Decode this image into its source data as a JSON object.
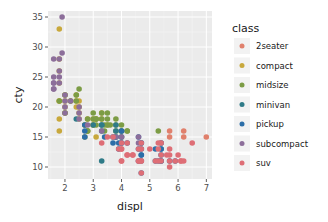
{
  "chart_data": {
    "type": "scatter",
    "title": "",
    "xlabel": "displ",
    "ylabel": "cty",
    "xlim": [
      1.4,
      7.2
    ],
    "ylim": [
      8,
      36
    ],
    "x_ticks": [
      2,
      3,
      4,
      5,
      6,
      7
    ],
    "y_ticks": [
      10,
      15,
      20,
      25,
      30,
      35
    ],
    "grid": true,
    "legend_position": "right",
    "legend_title": "class",
    "series": [
      {
        "name": "2seater",
        "color": "#E0806C",
        "points": [
          [
            5.7,
            16
          ],
          [
            5.7,
            15
          ],
          [
            6.2,
            16
          ],
          [
            6.2,
            15
          ],
          [
            7.0,
            15
          ]
        ]
      },
      {
        "name": "compact",
        "color": "#C8A83C",
        "points": [
          [
            1.8,
            18
          ],
          [
            1.8,
            21
          ],
          [
            2.0,
            20
          ],
          [
            2.0,
            21
          ],
          [
            2.8,
            16
          ],
          [
            2.8,
            18
          ],
          [
            3.1,
            18
          ],
          [
            1.8,
            28
          ],
          [
            1.8,
            26
          ],
          [
            1.8,
            24
          ],
          [
            1.8,
            21
          ],
          [
            1.8,
            16
          ],
          [
            1.8,
            33
          ],
          [
            2.0,
            22
          ],
          [
            2.0,
            19
          ],
          [
            2.4,
            21
          ],
          [
            2.4,
            22
          ],
          [
            2.5,
            21
          ],
          [
            2.5,
            20
          ],
          [
            2.5,
            19
          ],
          [
            2.2,
            21
          ],
          [
            3.0,
            18
          ],
          [
            3.3,
            19
          ],
          [
            3.0,
            17
          ],
          [
            2.5,
            18
          ],
          [
            2.7,
            17
          ],
          [
            3.1,
            15
          ],
          [
            3.3,
            18
          ],
          [
            3.5,
            17
          ],
          [
            2.4,
            20
          ]
        ]
      },
      {
        "name": "midsize",
        "color": "#7C9C45",
        "points": [
          [
            2.4,
            21
          ],
          [
            3.0,
            18
          ],
          [
            3.1,
            18
          ],
          [
            3.5,
            19
          ],
          [
            3.6,
            17
          ],
          [
            2.5,
            23
          ],
          [
            1.8,
            21
          ],
          [
            2.0,
            19
          ],
          [
            2.0,
            22
          ],
          [
            2.8,
            16
          ],
          [
            3.1,
            18
          ],
          [
            4.2,
            16
          ],
          [
            3.5,
            17
          ],
          [
            3.3,
            19
          ],
          [
            3.8,
            16
          ],
          [
            3.8,
            18
          ],
          [
            3.8,
            17
          ],
          [
            2.2,
            21
          ],
          [
            2.4,
            22
          ],
          [
            3.0,
            17
          ],
          [
            3.5,
            18
          ],
          [
            3.0,
            19
          ],
          [
            3.3,
            18
          ],
          [
            5.3,
            16
          ],
          [
            2.7,
            15
          ],
          [
            2.7,
            17
          ],
          [
            3.4,
            16
          ],
          [
            3.4,
            17
          ],
          [
            4.0,
            16
          ],
          [
            4.0,
            17
          ],
          [
            2.8,
            18
          ],
          [
            2.8,
            16
          ],
          [
            3.1,
            17
          ],
          [
            4.2,
            16
          ],
          [
            4.0,
            15
          ]
        ]
      },
      {
        "name": "minivan",
        "color": "#2F7B88",
        "points": [
          [
            2.4,
            18
          ],
          [
            3.0,
            17
          ],
          [
            3.3,
            17
          ],
          [
            3.3,
            16
          ],
          [
            3.3,
            11
          ],
          [
            3.8,
            16
          ],
          [
            3.8,
            15
          ],
          [
            4.0,
            16
          ],
          [
            3.8,
            17
          ],
          [
            3.3,
            17
          ],
          [
            3.8,
            15
          ]
        ]
      },
      {
        "name": "pickup",
        "color": "#2C6EA8",
        "points": [
          [
            2.7,
            15
          ],
          [
            2.7,
            16
          ],
          [
            2.7,
            17
          ],
          [
            3.4,
            15
          ],
          [
            3.7,
            15
          ],
          [
            3.7,
            14
          ],
          [
            3.9,
            14
          ],
          [
            3.9,
            13
          ],
          [
            4.0,
            14
          ],
          [
            4.0,
            15
          ],
          [
            4.7,
            14
          ],
          [
            4.7,
            13
          ],
          [
            4.7,
            12
          ],
          [
            4.7,
            9
          ],
          [
            5.2,
            11
          ],
          [
            5.2,
            13
          ],
          [
            5.7,
            11
          ],
          [
            5.9,
            11
          ],
          [
            4.6,
            13
          ],
          [
            5.4,
            12
          ],
          [
            5.4,
            11
          ],
          [
            5.4,
            13
          ],
          [
            4.2,
            14
          ],
          [
            4.0,
            16
          ],
          [
            4.6,
            15
          ],
          [
            5.4,
            14
          ],
          [
            4.7,
            11
          ],
          [
            5.3,
            11
          ],
          [
            5.4,
            11
          ],
          [
            5.4,
            13
          ],
          [
            4.7,
            12
          ],
          [
            4.6,
            11
          ],
          [
            4.7,
            14
          ],
          [
            4.0,
            14
          ]
        ]
      },
      {
        "name": "subcompact",
        "color": "#8C6E9A",
        "points": [
          [
            1.6,
            28
          ],
          [
            1.6,
            24
          ],
          [
            1.6,
            25
          ],
          [
            1.6,
            23
          ],
          [
            1.6,
            24
          ],
          [
            1.8,
            26
          ],
          [
            1.8,
            25
          ],
          [
            1.9,
            35
          ],
          [
            1.9,
            29
          ],
          [
            1.8,
            24
          ],
          [
            2.0,
            21
          ],
          [
            2.0,
            20
          ],
          [
            2.5,
            19
          ],
          [
            2.5,
            18
          ],
          [
            3.8,
            15
          ],
          [
            4.6,
            15
          ],
          [
            5.4,
            14
          ],
          [
            2.8,
            17
          ],
          [
            1.6,
            23
          ],
          [
            2.0,
            22
          ],
          [
            2.2,
            21
          ],
          [
            2.5,
            20
          ],
          [
            3.3,
            16
          ],
          [
            4.0,
            15
          ],
          [
            4.6,
            14
          ],
          [
            2.0,
            19
          ],
          [
            1.8,
            28
          ]
        ]
      },
      {
        "name": "suv",
        "color": "#DE6E76",
        "points": [
          [
            3.7,
            15
          ],
          [
            4.0,
            14
          ],
          [
            4.7,
            13
          ],
          [
            4.7,
            14
          ],
          [
            5.7,
            13
          ],
          [
            6.1,
            11
          ],
          [
            5.3,
            14
          ],
          [
            5.3,
            11
          ],
          [
            5.7,
            12
          ],
          [
            6.5,
            14
          ],
          [
            4.7,
            9
          ],
          [
            4.0,
            11
          ],
          [
            4.6,
            11
          ],
          [
            5.4,
            12
          ],
          [
            4.7,
            11
          ],
          [
            4.0,
            13
          ],
          [
            4.2,
            12
          ],
          [
            4.4,
            12
          ],
          [
            4.6,
            13
          ],
          [
            5.0,
            13
          ],
          [
            5.4,
            14
          ],
          [
            5.6,
            12
          ],
          [
            6.0,
            12
          ],
          [
            6.1,
            11
          ],
          [
            3.3,
            14
          ],
          [
            4.0,
            13
          ],
          [
            4.7,
            11
          ],
          [
            5.4,
            11
          ],
          [
            5.7,
            11
          ],
          [
            4.2,
            14
          ],
          [
            3.9,
            13
          ],
          [
            4.6,
            11
          ],
          [
            5.9,
            11
          ],
          [
            5.2,
            11
          ],
          [
            4.4,
            12
          ],
          [
            4.0,
            11
          ],
          [
            6.2,
            11
          ],
          [
            5.3,
            13
          ],
          [
            3.5,
            15
          ],
          [
            4.2,
            12
          ],
          [
            5.7,
            10
          ]
        ]
      }
    ]
  },
  "legend": {
    "title": "class",
    "items": [
      {
        "label": "2seater",
        "color": "#E0806C"
      },
      {
        "label": "compact",
        "color": "#C8A83C"
      },
      {
        "label": "midsize",
        "color": "#7C9C45"
      },
      {
        "label": "minivan",
        "color": "#2F7B88"
      },
      {
        "label": "pickup",
        "color": "#2C6EA8"
      },
      {
        "label": "subcompact",
        "color": "#8C6E9A"
      },
      {
        "label": "suv",
        "color": "#DE6E76"
      }
    ]
  },
  "axes": {
    "x_title": "displ",
    "y_title": "cty",
    "x_tick_labels": [
      "2",
      "3",
      "4",
      "5",
      "6",
      "7"
    ],
    "y_tick_labels": [
      "10",
      "15",
      "20",
      "25",
      "30",
      "35"
    ]
  }
}
